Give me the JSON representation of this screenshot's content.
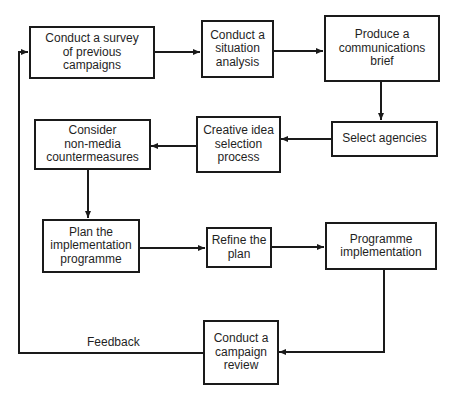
{
  "diagram": {
    "type": "flowchart",
    "nodes": [
      {
        "id": "survey",
        "label": "Conduct a survey\nof previous\ncampaigns"
      },
      {
        "id": "situation",
        "label": "Conduct a\nsituation\nanalysis"
      },
      {
        "id": "brief",
        "label": "Produce a\ncommunications\nbrief"
      },
      {
        "id": "agencies",
        "label": "Select agencies"
      },
      {
        "id": "creative",
        "label": "Creative idea\nselection\nprocess"
      },
      {
        "id": "nonmedia",
        "label": "Consider\nnon-media\ncountermeasures"
      },
      {
        "id": "plan",
        "label": "Plan the\nimplementation\nprogramme"
      },
      {
        "id": "refine",
        "label": "Refine the\nplan"
      },
      {
        "id": "implementation",
        "label": "Programme\nimplementation"
      },
      {
        "id": "review",
        "label": "Conduct a\ncampaign\nreview"
      }
    ],
    "edges": [
      {
        "from": "survey",
        "to": "situation"
      },
      {
        "from": "situation",
        "to": "brief"
      },
      {
        "from": "brief",
        "to": "agencies"
      },
      {
        "from": "agencies",
        "to": "creative"
      },
      {
        "from": "creative",
        "to": "nonmedia"
      },
      {
        "from": "nonmedia",
        "to": "plan"
      },
      {
        "from": "plan",
        "to": "refine"
      },
      {
        "from": "refine",
        "to": "implementation"
      },
      {
        "from": "implementation",
        "to": "review"
      },
      {
        "from": "review",
        "to": "survey",
        "label": "Feedback"
      }
    ],
    "feedback_label": "Feedback",
    "colors": {
      "line": "#1a1a1a",
      "background": "#ffffff"
    }
  }
}
